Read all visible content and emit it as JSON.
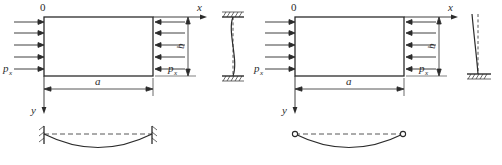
{
  "figure": {
    "stroke_color": "#2b2b2b",
    "background_color": "#ffffff",
    "panels": [
      {
        "id": "left",
        "name": "fixed-fixed",
        "origin_label": "0",
        "axis_x_label": "x",
        "axis_y_label": "y",
        "dimension_horizontal": "a",
        "dimension_vertical": "b",
        "load_label_left": "p",
        "load_label_left_sub": "x",
        "load_label_right": "p",
        "load_label_right_sub": "x",
        "arrow_rows": 5,
        "column_support_top": "fixed",
        "column_support_bottom": "fixed",
        "beam_support_left": "fixed",
        "beam_support_right": "fixed"
      },
      {
        "id": "right",
        "name": "fixed-free",
        "origin_label": "0",
        "axis_x_label": "x",
        "axis_y_label": "y",
        "dimension_horizontal": "a",
        "dimension_vertical": "b",
        "load_label_left": "p",
        "load_label_left_sub": "x",
        "load_label_right": "p",
        "load_label_right_sub": "x",
        "arrow_rows": 5,
        "column_support_top": "free",
        "column_support_bottom": "fixed",
        "beam_support_left": "pinned",
        "beam_support_right": "pinned"
      }
    ]
  }
}
